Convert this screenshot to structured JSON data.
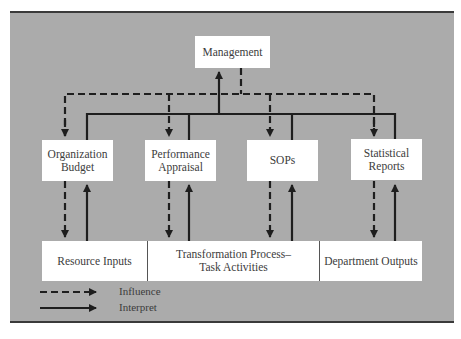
{
  "diagram": {
    "colors": {
      "panel_background": "#ababab",
      "box_background": "#ffffff",
      "line_color": "#1e1e1e",
      "text_color": "#3c3c3c",
      "rule_color": "#3a3a3a"
    },
    "top_node": {
      "label": "Management"
    },
    "middle_nodes": [
      {
        "line1": "Organization",
        "line2": "Budget"
      },
      {
        "line1": "Performance",
        "line2": "Appraisal"
      },
      {
        "line1": "SOPs",
        "line2": ""
      },
      {
        "line1": "Statistical",
        "line2": "Reports"
      }
    ],
    "process_bar": [
      {
        "line1": "Resource Inputs",
        "line2": ""
      },
      {
        "line1": "Transformation Process–",
        "line2": "Task Activities"
      },
      {
        "line1": "Department Outputs",
        "line2": ""
      }
    ],
    "edges": [
      {
        "from": "Management",
        "to": "Organization Budget",
        "type": "Influence"
      },
      {
        "from": "Management",
        "to": "Performance Appraisal",
        "type": "Influence"
      },
      {
        "from": "Management",
        "to": "SOPs",
        "type": "Influence"
      },
      {
        "from": "Management",
        "to": "Statistical Reports",
        "type": "Influence"
      },
      {
        "from": "Organization Budget",
        "to": "Management",
        "type": "Interpret"
      },
      {
        "from": "Performance Appraisal",
        "to": "Management",
        "type": "Interpret"
      },
      {
        "from": "SOPs",
        "to": "Management",
        "type": "Interpret"
      },
      {
        "from": "Statistical Reports",
        "to": "Management",
        "type": "Interpret"
      },
      {
        "from": "Organization Budget",
        "to": "Resource Inputs",
        "type": "Influence"
      },
      {
        "from": "Resource Inputs",
        "to": "Organization Budget",
        "type": "Interpret"
      },
      {
        "from": "Performance Appraisal",
        "to": "Transformation Process–Task Activities",
        "type": "Influence"
      },
      {
        "from": "Transformation Process–Task Activities",
        "to": "Performance Appraisal",
        "type": "Interpret"
      },
      {
        "from": "SOPs",
        "to": "Transformation Process–Task Activities",
        "type": "Influence"
      },
      {
        "from": "Transformation Process–Task Activities",
        "to": "SOPs",
        "type": "Interpret"
      },
      {
        "from": "Statistical Reports",
        "to": "Department Outputs",
        "type": "Influence"
      },
      {
        "from": "Department Outputs",
        "to": "Statistical Reports",
        "type": "Interpret"
      }
    ],
    "legend": [
      {
        "style": "dashed",
        "label": "Influence"
      },
      {
        "style": "solid",
        "label": "Interpret"
      }
    ]
  }
}
